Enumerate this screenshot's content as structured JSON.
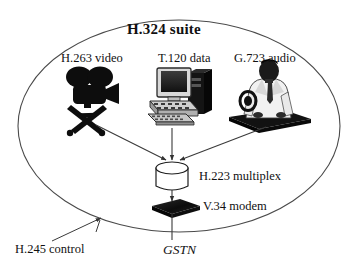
{
  "diagram": {
    "title": "H.324 suite",
    "boundary": {
      "shape": "ellipse",
      "name": "h324-suite-boundary"
    },
    "nodes": [
      {
        "id": "video",
        "label": "H.263 video",
        "icon": "movie-camera-icon"
      },
      {
        "id": "data",
        "label": "T.120 data",
        "icon": "desktop-computer-icon"
      },
      {
        "id": "audio",
        "label": "G.723 audio",
        "icon": "person-headset-icon"
      },
      {
        "id": "multiplex",
        "label": "H.223 multiplex",
        "icon": "cylinder-icon"
      },
      {
        "id": "modem",
        "label": "V.34 modem",
        "icon": "modem-slab-icon"
      }
    ],
    "annotations": [
      {
        "id": "control",
        "label": "H.245 control"
      },
      {
        "id": "network",
        "label": "GSTN"
      }
    ],
    "colors": {
      "ink": "#111111",
      "line": "#4a4a4a",
      "fill": "#ffffff",
      "icon_dark": "#101010"
    }
  }
}
